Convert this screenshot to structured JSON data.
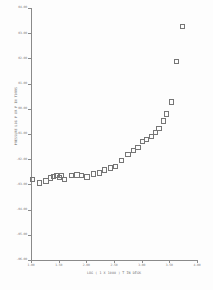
{
  "figure": {
    "background": "#fdfdfd",
    "axis_color": "#8a8a8a",
    "marker_color": "#757575"
  },
  "chart_data": {
    "type": "scatter",
    "title": "",
    "xlabel": "LOG ( 1 X 1000 )   T IN DEGK",
    "ylabel": "PRESSURE LOG P OR P   IN TORRS",
    "xlim": [
      1.0,
      4.0
    ],
    "ylim": [
      -6.0,
      4.0
    ],
    "grid": false,
    "legend": "none",
    "marker": "open-square",
    "xticks": [
      "1.00",
      "1.50",
      "2.00",
      "2.50",
      "3.00",
      "3.50",
      "4.00"
    ],
    "xtick_values": [
      1.0,
      1.5,
      2.0,
      2.5,
      3.0,
      3.5,
      4.0
    ],
    "yticks": [
      "-06.00",
      "-05.00",
      "-04.00",
      "-03.00",
      "-02.00",
      "-01.00",
      "00.00",
      "01.00",
      "02.00",
      "03.00",
      "04.00"
    ],
    "ytick_values": [
      -6.0,
      -5.0,
      -4.0,
      -3.0,
      -2.0,
      -1.0,
      0.0,
      1.0,
      2.0,
      3.0,
      4.0
    ],
    "points": [
      {
        "x": 1.02,
        "y": -2.78
      },
      {
        "x": 1.14,
        "y": -2.92
      },
      {
        "x": 1.26,
        "y": -2.84
      },
      {
        "x": 1.34,
        "y": -2.72
      },
      {
        "x": 1.4,
        "y": -2.66
      },
      {
        "x": 1.45,
        "y": -2.62
      },
      {
        "x": 1.5,
        "y": -2.7
      },
      {
        "x": 1.54,
        "y": -2.62
      },
      {
        "x": 1.6,
        "y": -2.78
      },
      {
        "x": 1.72,
        "y": -2.62
      },
      {
        "x": 1.82,
        "y": -2.6
      },
      {
        "x": 1.9,
        "y": -2.62
      },
      {
        "x": 2.0,
        "y": -2.68
      },
      {
        "x": 2.12,
        "y": -2.56
      },
      {
        "x": 2.22,
        "y": -2.52
      },
      {
        "x": 2.32,
        "y": -2.4
      },
      {
        "x": 2.42,
        "y": -2.32
      },
      {
        "x": 2.52,
        "y": -2.26
      },
      {
        "x": 2.62,
        "y": -2.04
      },
      {
        "x": 2.74,
        "y": -1.8
      },
      {
        "x": 2.84,
        "y": -1.62
      },
      {
        "x": 2.92,
        "y": -1.5
      },
      {
        "x": 3.0,
        "y": -1.28
      },
      {
        "x": 3.08,
        "y": -1.18
      },
      {
        "x": 3.16,
        "y": -1.06
      },
      {
        "x": 3.24,
        "y": -0.92
      },
      {
        "x": 3.3,
        "y": -0.76
      },
      {
        "x": 3.38,
        "y": -0.46
      },
      {
        "x": 3.44,
        "y": -0.18
      },
      {
        "x": 3.52,
        "y": 0.3
      },
      {
        "x": 3.62,
        "y": 1.9
      },
      {
        "x": 3.72,
        "y": 3.3
      }
    ]
  }
}
